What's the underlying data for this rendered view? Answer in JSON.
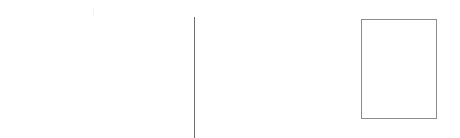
{
  "canvas": {
    "background": "#ffffff"
  },
  "elements": {
    "divider": {
      "color": "#6f6f6f"
    },
    "frame": {
      "border_color": "#8c8c8c"
    }
  }
}
